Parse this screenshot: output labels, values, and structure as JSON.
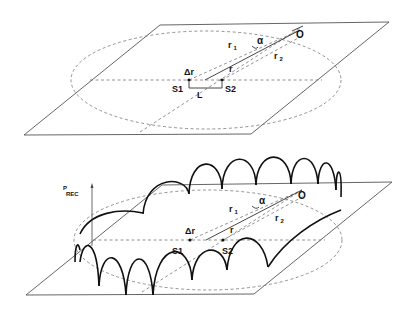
{
  "figure": {
    "top_panel": {
      "description": "Planar geometry: two sources S1, S2 separated by L, observer O at distances r1 and r2, angle alpha",
      "labels": {
        "observer": "O",
        "r1": "r",
        "r1_sub": "1",
        "r2": "r",
        "r2_sub": "2",
        "alpha": "α",
        "delta_r": "Δr",
        "r": "r",
        "source1": "S1",
        "source2": "S2",
        "separation": "L"
      }
    },
    "bottom_panel": {
      "description": "Received power interference lobes around the circle of observer positions",
      "axis_label": "P",
      "axis_label_sub": "REC",
      "labels": {
        "observer": "O",
        "r1": "r",
        "r1_sub": "1",
        "r2": "r",
        "r2_sub": "2",
        "alpha": "α",
        "delta_r": "Δr",
        "r": "r",
        "source1": "S1",
        "source2": "S2"
      }
    }
  }
}
